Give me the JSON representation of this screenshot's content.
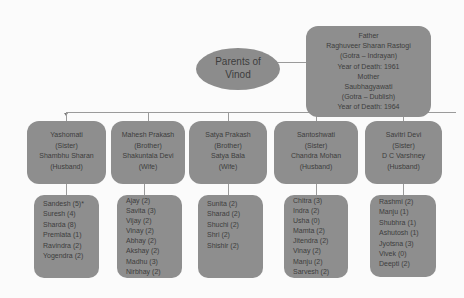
{
  "root": {
    "lines": [
      "Father",
      "Raghuveer Sharan Rastogi",
      "(Gotra – Indrayan)",
      "Year of Death: 1961",
      "Mother",
      "Saubhagyawati",
      "(Gotra – Dublish)",
      "Year of Death: 1964"
    ]
  },
  "label": {
    "lines": [
      "Parents of",
      "Vinod"
    ]
  },
  "siblings": [
    {
      "lines": [
        "Yashomati",
        "(Sister)",
        "Shambhu Sharan",
        "(Husband)"
      ],
      "children": [
        "Sandesh (5)*",
        "Suresh (4)",
        "Sharda (8)",
        "Premlata (1)",
        "Ravindra (2)",
        "Yogendra (2)"
      ]
    },
    {
      "lines": [
        "Mahesh Prakash",
        "(Brother)",
        "Shakuntala Devi",
        "(Wife)"
      ],
      "children": [
        "Ajay (2)",
        "Savita (3)",
        "Vijay (2)",
        "Vinay (2)",
        "Abhay (2)",
        "Akshay (2)",
        "Madhu (3)",
        "Nirbhay (2)"
      ]
    },
    {
      "lines": [
        "Satya Prakash",
        "(Brother)",
        "Satya Bala",
        "(Wife)"
      ],
      "children": [
        "Sunita (2)",
        "Sharad (2)",
        "Shuchi (2)",
        "Shri (2)",
        "Shishir (2)"
      ]
    },
    {
      "lines": [
        "Santoshwati",
        "(Sister)",
        "Chandra Mohan",
        "(Husband)"
      ],
      "children": [
        "Chitra (3)",
        "Indra (2)",
        "Usha (0)",
        "Mamta (2)",
        "Jitendra (2)",
        "Vinay (2)",
        "Manju (2)",
        "Sarvesh (2)"
      ]
    },
    {
      "lines": [
        "Savitri Devi",
        "(Sister)",
        "D C Varshney",
        "(Husband)"
      ],
      "children": [
        "Rashmi (2)",
        "Manju (1)",
        "Shubhra (1)",
        "Ashutosh (1)",
        "Jyotsna (3)",
        "Vivek (0)",
        "Deepti (2)"
      ]
    }
  ],
  "colors": {
    "box_fill": "#8e8e8e",
    "text": "#3d3d3d",
    "line": "#9a9a9a",
    "background": "#fbfbfb"
  }
}
